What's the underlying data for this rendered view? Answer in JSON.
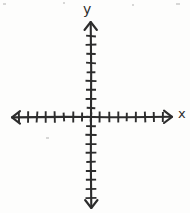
{
  "figure": {
    "kind": "hand-drawn-coordinate-plane",
    "title": "",
    "background_color": "#fdfdfc",
    "ink_color": "#2c2c2c",
    "width": 190,
    "height": 213
  },
  "labels": {
    "y_axis": "y",
    "x_axis": "x"
  },
  "chart_data": {
    "type": "scatter",
    "title": "",
    "xlabel": "x",
    "ylabel": "y",
    "x": [],
    "y": [],
    "series": [],
    "grid": false,
    "legend": "none",
    "xlim": [
      -9,
      9
    ],
    "ylim": [
      -10,
      10
    ],
    "xticks": [
      -8,
      -7,
      -6,
      -5,
      -4,
      -3,
      -2,
      -1,
      0,
      1,
      2,
      3,
      4,
      5,
      6,
      7,
      8
    ],
    "yticks": [
      -9,
      -8,
      -7,
      -6,
      -5,
      -4,
      -3,
      -2,
      -1,
      0,
      1,
      2,
      3,
      4,
      5,
      6,
      7,
      8,
      9
    ],
    "tick_labels_shown": false,
    "axis_arrows": [
      "left",
      "right",
      "up",
      "down"
    ],
    "annotations": []
  },
  "geometry": {
    "origin": {
      "x": 91,
      "y": 117
    },
    "x_axis": {
      "start_x": 12,
      "end_x": 172,
      "y": 117
    },
    "y_axis": {
      "x": 91,
      "start_y": 22,
      "end_y": 208
    },
    "tick_spacing_px": 9,
    "x_tick_half_len": 5,
    "y_tick_half_len": 5,
    "stroke_width": 2.1
  },
  "artifacts": [
    {
      "left": 3,
      "top": 3,
      "width": 3,
      "height": 2
    },
    {
      "left": 63,
      "top": 2,
      "width": 2,
      "height": 2
    },
    {
      "left": 132,
      "top": 4,
      "width": 2,
      "height": 2
    },
    {
      "left": 176,
      "top": 3,
      "width": 4,
      "height": 2
    },
    {
      "left": 46,
      "top": 137,
      "width": 3,
      "height": 2
    }
  ]
}
